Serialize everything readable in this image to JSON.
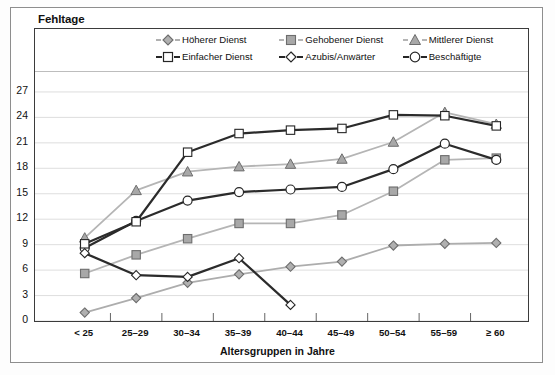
{
  "chart_data": {
    "type": "line",
    "title": "Fehltage",
    "xlabel": "Altersgruppen in Jahre",
    "ylabel": "Fehltage",
    "grid": true,
    "legend_position": "top-inside",
    "ylim": [
      0,
      29
    ],
    "yticks": [
      0,
      3,
      6,
      9,
      12,
      15,
      18,
      21,
      24,
      27
    ],
    "categories": [
      "< 25",
      "25–29",
      "30–34",
      "35–39",
      "40–44",
      "45–49",
      "50–54",
      "55–59",
      "≥ 60"
    ],
    "series": [
      {
        "name": "Höherer Dienst",
        "marker": "diamond",
        "marker_fill": "#b0b0b0",
        "line_color": "#adadad",
        "values": [
          1.0,
          2.7,
          4.5,
          5.5,
          6.4,
          7.0,
          8.9,
          9.1,
          9.2
        ]
      },
      {
        "name": "Gehobener Dienst",
        "marker": "square",
        "marker_fill": "#a8a8a8",
        "line_color": "#b5b5b5",
        "values": [
          5.6,
          7.8,
          9.7,
          11.5,
          11.5,
          12.5,
          15.3,
          19.0,
          19.2
        ]
      },
      {
        "name": "Mittlerer Dienst",
        "marker": "triangle",
        "marker_fill": "#a8a8a8",
        "line_color": "#b5b5b5",
        "values": [
          9.8,
          15.4,
          17.6,
          18.2,
          18.5,
          19.1,
          21.1,
          24.6,
          23.2
        ]
      },
      {
        "name": "Einfacher Dienst",
        "marker": "square-open",
        "marker_fill": "#ffffff",
        "line_color": "#2b2b2b",
        "values": [
          9.1,
          11.7,
          19.9,
          22.1,
          22.5,
          22.7,
          24.3,
          24.2,
          23.0
        ]
      },
      {
        "name": "Azubis/Anwärter",
        "marker": "diamond-open",
        "marker_fill": "#ffffff",
        "line_color": "#2b2b2b",
        "values": [
          8.0,
          5.4,
          5.2,
          7.4,
          1.9,
          null,
          null,
          null,
          null
        ]
      },
      {
        "name": "Beschäftigte",
        "marker": "circle-open",
        "marker_fill": "#ffffff",
        "line_color": "#2b2b2b",
        "values": [
          8.6,
          11.8,
          14.2,
          15.2,
          15.5,
          15.8,
          17.9,
          20.9,
          19.0
        ]
      }
    ]
  },
  "legend": {
    "items": [
      {
        "label": "Höherer Dienst",
        "icon": "diamond-filled-marker-icon"
      },
      {
        "label": "Gehobener Dienst",
        "icon": "square-filled-marker-icon"
      },
      {
        "label": "Mittlerer Dienst",
        "icon": "triangle-filled-marker-icon"
      },
      {
        "label": "Einfacher Dienst",
        "icon": "square-open-marker-icon"
      },
      {
        "label": "Azubis/Anwärter",
        "icon": "diamond-open-marker-icon"
      },
      {
        "label": "Beschäftigte",
        "icon": "circle-open-marker-icon"
      }
    ]
  }
}
